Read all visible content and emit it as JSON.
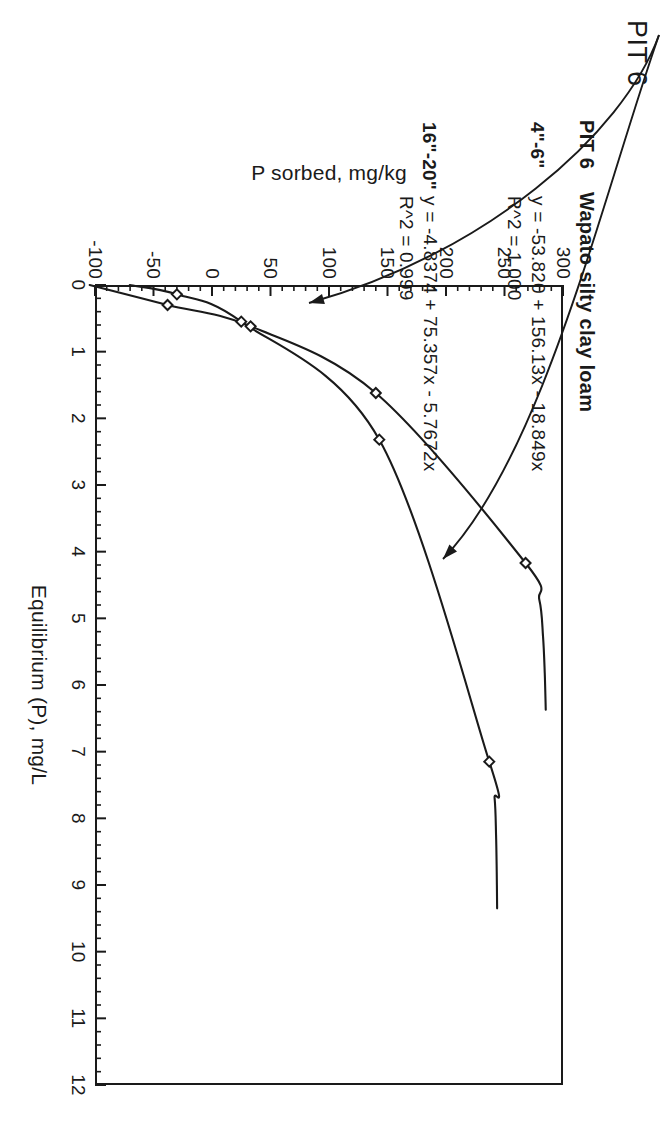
{
  "figure": {
    "corner_label": "PIT 6",
    "title_pit": "PIT 6",
    "title_soil": "Wapato silty clay loam"
  },
  "annotations": {
    "series_a_label": "4\"-6\"",
    "series_a_equation": "y = -53.820 + 156.13x - 18.849x",
    "series_a_r2": "R^2 = 1.000",
    "series_b_label": "16\"-20\"",
    "series_b_equation": "y = -4.8374 + 75.357x - 5.7672x",
    "series_b_r2": "R^2 = 0.999"
  },
  "axes": {
    "x_title": "Equilibrium (P), mg/L",
    "y_title": "P sorbed, mg/kg",
    "x_ticks": [
      "0",
      "1",
      "2",
      "3",
      "4",
      "5",
      "6",
      "7",
      "8",
      "9",
      "10",
      "11",
      "12"
    ],
    "y_ticks": [
      "300",
      "250",
      "200",
      "150",
      "100",
      "50",
      "0",
      "-50",
      "-100"
    ]
  },
  "chart_data": {
    "type": "scatter",
    "title": "PIT 6  Wapato silty clay loam",
    "xlabel": "Equilibrium (P), mg/L",
    "ylabel": "P sorbed, mg/kg",
    "xlim": [
      0,
      12
    ],
    "ylim": [
      -100,
      300
    ],
    "xticks": [
      0,
      1,
      2,
      3,
      4,
      5,
      6,
      7,
      8,
      9,
      10,
      11,
      12
    ],
    "yticks": [
      -100,
      -50,
      0,
      50,
      100,
      150,
      200,
      250,
      300
    ],
    "grid": false,
    "legend": "annotated-inline",
    "marker": "open-diamond",
    "series": [
      {
        "name": "4\"-6\"",
        "equation": "y = -53.820 + 156.13x - 18.849x",
        "r2": "1.000",
        "coefficients": {
          "intercept": -53.82,
          "linear": 156.13,
          "quadratic": -18.849
        },
        "points": [
          {
            "x": 0.3,
            "y": -38
          },
          {
            "x": 0.62,
            "y": 33
          },
          {
            "x": 1.62,
            "y": 140
          },
          {
            "x": 4.17,
            "y": 268
          }
        ]
      },
      {
        "name": "16\"-20\"",
        "equation": "y = -4.8374 + 75.357x - 5.7672x",
        "r2": "0.999",
        "coefficients": {
          "intercept": -4.8374,
          "linear": 75.357,
          "quadratic": -5.7672
        },
        "points": [
          {
            "x": 0.14,
            "y": -30
          },
          {
            "x": 0.55,
            "y": 25
          },
          {
            "x": 2.32,
            "y": 143
          },
          {
            "x": 7.15,
            "y": 237
          }
        ]
      }
    ]
  }
}
